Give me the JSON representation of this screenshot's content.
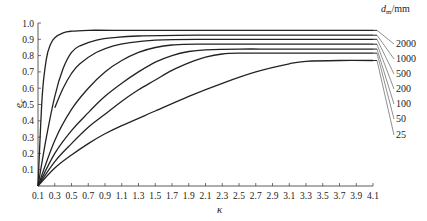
{
  "chart_data": {
    "type": "line",
    "title": "",
    "xlabel": "κ",
    "ylabel": "e_c",
    "xlim": [
      0.1,
      4.1
    ],
    "ylim": [
      0,
      1.0
    ],
    "x_ticks": [
      "0.1",
      "0.3",
      "0.5",
      "0.7",
      "0.9",
      "1.1",
      "1.3",
      "1.5",
      "1.7",
      "1.9",
      "2.1",
      "2.3",
      "2.5",
      "2.7",
      "2.9",
      "3.1",
      "3.3",
      "3.5",
      "3.7",
      "3.9",
      "4.1"
    ],
    "y_ticks": [
      "0.1",
      "0.2",
      "0.3",
      "0.4",
      "0.5",
      "0.6",
      "0.7",
      "0.8",
      "0.9",
      "1.0"
    ],
    "grid": false,
    "legend_title": "d_m/mm",
    "legend_position": "right, leader lines",
    "series": [
      {
        "name": "2000",
        "x": [
          0.1,
          0.15,
          0.2,
          0.25,
          0.3,
          0.4,
          0.5,
          0.7,
          1.0,
          2.0,
          3.0,
          4.1
        ],
        "values": [
          0.0,
          0.55,
          0.78,
          0.87,
          0.91,
          0.94,
          0.95,
          0.955,
          0.955,
          0.955,
          0.955,
          0.955
        ]
      },
      {
        "name": "1000",
        "x": [
          0.1,
          0.2,
          0.3,
          0.4,
          0.5,
          0.6,
          0.8,
          1.0,
          1.3,
          2.0,
          3.0,
          4.1
        ],
        "values": [
          0.0,
          0.3,
          0.55,
          0.72,
          0.82,
          0.86,
          0.895,
          0.91,
          0.92,
          0.925,
          0.925,
          0.925
        ]
      },
      {
        "name": "500",
        "x": [
          0.3,
          0.4,
          0.5,
          0.6,
          0.8,
          1.0,
          1.2,
          1.5,
          2.0,
          3.0,
          4.1
        ],
        "values": [
          0.48,
          0.6,
          0.69,
          0.75,
          0.82,
          0.86,
          0.88,
          0.895,
          0.9,
          0.9,
          0.9
        ]
      },
      {
        "name": "200",
        "x": [
          0.1,
          0.3,
          0.5,
          0.7,
          0.9,
          1.1,
          1.3,
          1.5,
          1.7,
          2.0,
          3.0,
          4.1
        ],
        "values": [
          0.0,
          0.28,
          0.47,
          0.6,
          0.7,
          0.77,
          0.82,
          0.85,
          0.865,
          0.87,
          0.87,
          0.87
        ]
      },
      {
        "name": "100",
        "x": [
          0.1,
          0.3,
          0.5,
          0.7,
          0.9,
          1.1,
          1.3,
          1.5,
          1.7,
          1.9,
          2.1,
          2.5,
          3.0,
          4.1
        ],
        "values": [
          0.0,
          0.2,
          0.34,
          0.45,
          0.55,
          0.63,
          0.7,
          0.76,
          0.8,
          0.825,
          0.835,
          0.84,
          0.84,
          0.84
        ]
      },
      {
        "name": "50",
        "x": [
          0.1,
          0.3,
          0.5,
          0.7,
          0.9,
          1.1,
          1.3,
          1.5,
          1.7,
          1.9,
          2.1,
          2.3,
          2.5,
          3.0,
          4.1
        ],
        "values": [
          0.0,
          0.15,
          0.26,
          0.36,
          0.44,
          0.52,
          0.59,
          0.65,
          0.71,
          0.755,
          0.79,
          0.81,
          0.815,
          0.815,
          0.815
        ]
      },
      {
        "name": "25",
        "x": [
          0.1,
          0.3,
          0.5,
          0.7,
          0.9,
          1.1,
          1.5,
          1.9,
          2.3,
          2.7,
          3.1,
          3.3,
          3.7,
          4.1
        ],
        "values": [
          0.0,
          0.11,
          0.19,
          0.26,
          0.32,
          0.37,
          0.46,
          0.55,
          0.63,
          0.7,
          0.75,
          0.765,
          0.77,
          0.77
        ]
      }
    ]
  },
  "labels": {
    "ylabel": "e",
    "ylabel_sub": "c",
    "xlabel": "κ",
    "legend_title_main": "d",
    "legend_title_sub": "m",
    "legend_title_unit": "/mm"
  }
}
